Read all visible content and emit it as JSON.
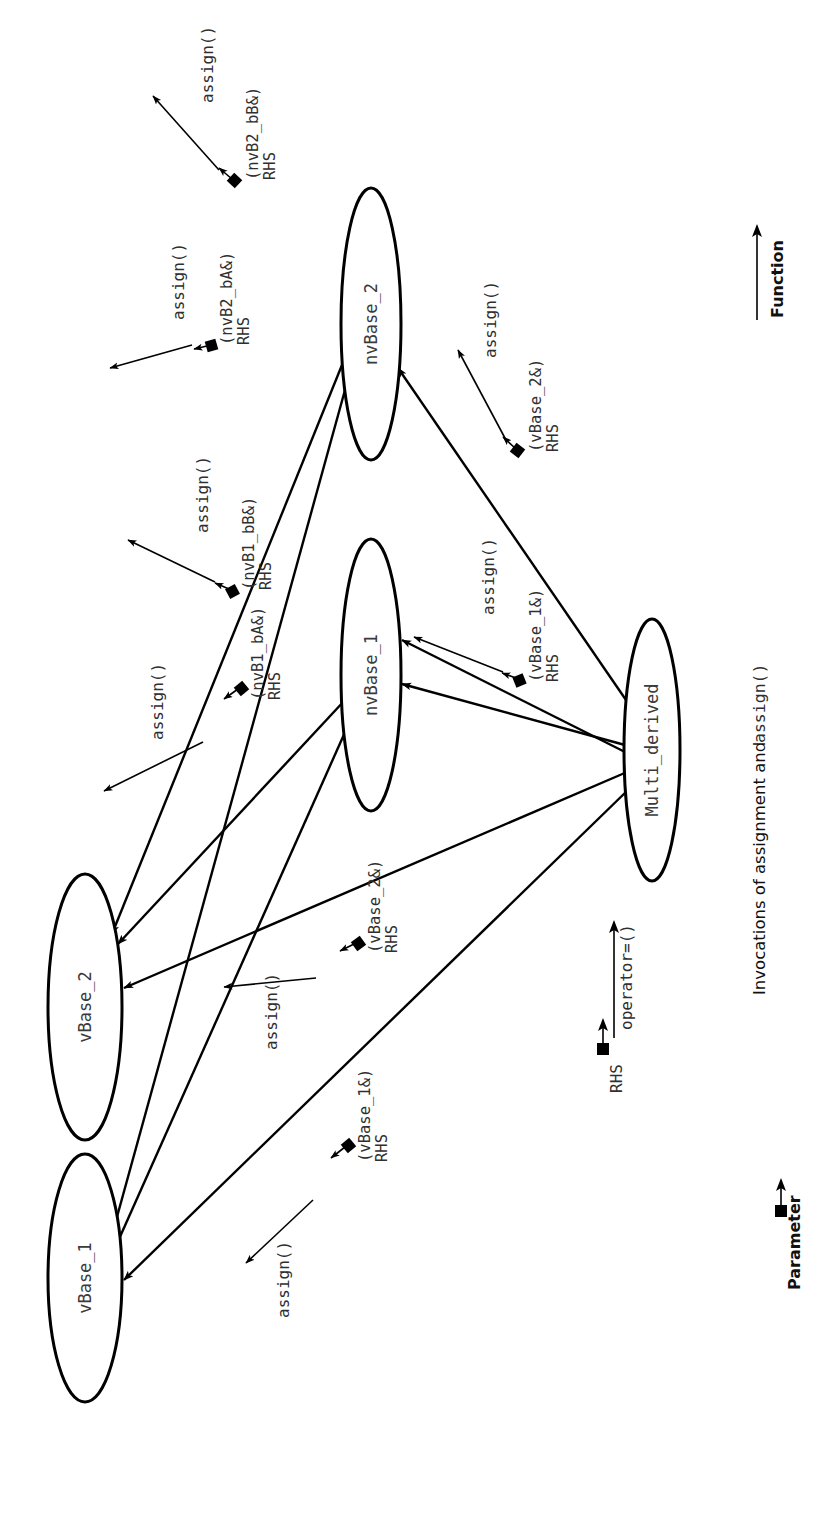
{
  "figure": {
    "caption_plain": "Invocations of assignment and ",
    "caption_mono": "assign()",
    "orientation": "rotated-90-ccw",
    "background": "#ffffff",
    "ink_color": "#000000",
    "label_color": "#2f2f2f"
  },
  "legend": {
    "function": {
      "label": "Function",
      "glyph": "arrow-solid"
    },
    "parameter": {
      "label": "Parameter",
      "glyph": "square-arrow"
    }
  },
  "nodes": [
    {
      "id": "vBase_1",
      "label": "vBase_1",
      "cx": 85,
      "cy": 1278,
      "rx": 37,
      "ry": 124
    },
    {
      "id": "vBase_2",
      "label": "vBase_2",
      "cx": 85,
      "cy": 1007,
      "rx": 37,
      "ry": 133
    },
    {
      "id": "nvBase_1",
      "label": "nvBase_1",
      "cx": 371,
      "cy": 675,
      "rx": 30,
      "ry": 136
    },
    {
      "id": "nvBase_2",
      "label": "nvBase_2",
      "cx": 371,
      "cy": 324,
      "rx": 30,
      "ry": 136
    },
    {
      "id": "Multi_derived",
      "label": "Multi_derived",
      "cx": 652,
      "cy": 750,
      "rx": 28,
      "ry": 131
    }
  ],
  "edges": [
    {
      "from": "Multi_derived",
      "to": "vBase_1",
      "kind": "call"
    },
    {
      "from": "Multi_derived",
      "to": "vBase_2",
      "kind": "call"
    },
    {
      "from": "Multi_derived",
      "to": "nvBase_1",
      "kind": "call"
    },
    {
      "from": "Multi_derived",
      "to": "nvBase_1",
      "kind": "call"
    },
    {
      "from": "Multi_derived",
      "to": "nvBase_2",
      "kind": "call"
    },
    {
      "from": "nvBase_1",
      "to": "vBase_1",
      "kind": "call"
    },
    {
      "from": "nvBase_1",
      "to": "vBase_2",
      "kind": "call"
    },
    {
      "from": "nvBase_2",
      "to": "vBase_1",
      "kind": "call"
    },
    {
      "from": "nvBase_2",
      "to": "vBase_2",
      "kind": "call"
    }
  ],
  "callouts": [
    {
      "id": "nvB2_bB",
      "func": "assign()",
      "param_open": "(nvB2_bB&)",
      "param_tail": "RHS"
    },
    {
      "id": "nvB2_bA",
      "func": "assign()",
      "param_open": "(nvB2_bA&)",
      "param_tail": "RHS"
    },
    {
      "id": "nvB1_bB",
      "func": "assign()",
      "param_open": "(nvB1_bB&)",
      "param_tail": "RHS"
    },
    {
      "id": "nvB1_bA",
      "func": "assign()",
      "param_open": "(nvB1_bA&)",
      "param_tail": "RHS"
    },
    {
      "id": "vBase_2_n",
      "func": "assign()",
      "param_open": "(vBase_2&)",
      "param_tail": "RHS"
    },
    {
      "id": "vBase_1_n",
      "func": "assign()",
      "param_open": "(vBase_1&)",
      "param_tail": "RHS"
    },
    {
      "id": "vBase_2_v",
      "func": "assign()",
      "param_open": "(vBase_2&)",
      "param_tail": "RHS"
    },
    {
      "id": "vBase_1_v",
      "func": "assign()",
      "param_open": "(vBase_1&)",
      "param_tail": "RHS"
    }
  ],
  "entry": {
    "func": "operator=()",
    "param": "RHS"
  }
}
